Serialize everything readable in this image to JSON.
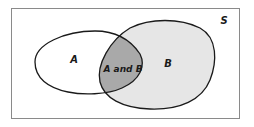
{
  "diagram": {
    "type": "venn",
    "universe_label": "S",
    "sets": [
      {
        "name": "A",
        "label": "A",
        "fill": "#ffffff"
      },
      {
        "name": "B",
        "label": "B",
        "fill": "#e6e6e6"
      }
    ],
    "intersection": {
      "label": "A and B",
      "fill": "#a9a9a9"
    },
    "colors": {
      "frame": "#8a8a8a",
      "outline": "#1a1a1a",
      "background": "#ffffff"
    }
  }
}
